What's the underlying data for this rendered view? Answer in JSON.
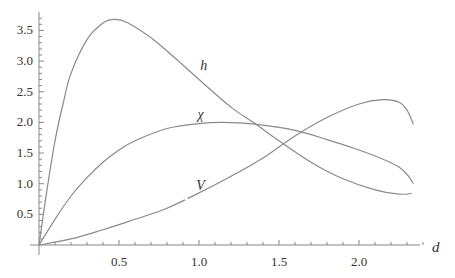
{
  "chart_data": {
    "type": "line",
    "title": "",
    "xlabel": "d",
    "ylabel": "",
    "xlim": [
      0,
      2.45
    ],
    "ylim": [
      0,
      3.8
    ],
    "grid": false,
    "legend": "inline curve labels",
    "x_ticks": [
      0.5,
      1.0,
      1.5,
      2.0
    ],
    "x_tick_labels": [
      "0.5",
      "1.0",
      "1.5",
      "2.0"
    ],
    "y_ticks": [
      0.5,
      1.0,
      1.5,
      2.0,
      2.5,
      3.0,
      3.5
    ],
    "y_tick_labels": [
      "0.5",
      "1.0",
      "1.5",
      "2.0",
      "2.5",
      "3.0",
      "3.5"
    ],
    "series": [
      {
        "name": "h",
        "label_pos": [
          1.03,
          2.85
        ],
        "points": [
          [
            0,
            0
          ],
          [
            0.05,
            0.9
          ],
          [
            0.1,
            1.7
          ],
          [
            0.15,
            2.3
          ],
          [
            0.2,
            2.8
          ],
          [
            0.3,
            3.35
          ],
          [
            0.4,
            3.62
          ],
          [
            0.47,
            3.68
          ],
          [
            0.55,
            3.63
          ],
          [
            0.7,
            3.38
          ],
          [
            0.85,
            3.05
          ],
          [
            1.0,
            2.7
          ],
          [
            1.2,
            2.25
          ],
          [
            1.35,
            1.98
          ],
          [
            1.5,
            1.7
          ],
          [
            1.7,
            1.35
          ],
          [
            1.9,
            1.08
          ],
          [
            2.1,
            0.9
          ],
          [
            2.25,
            0.83
          ],
          [
            2.33,
            0.84
          ]
        ]
      },
      {
        "name": "χ",
        "label_pos": [
          1.01,
          2.05
        ],
        "points": [
          [
            0,
            0
          ],
          [
            0.1,
            0.42
          ],
          [
            0.2,
            0.8
          ],
          [
            0.3,
            1.1
          ],
          [
            0.4,
            1.35
          ],
          [
            0.5,
            1.55
          ],
          [
            0.6,
            1.7
          ],
          [
            0.8,
            1.9
          ],
          [
            1.0,
            1.98
          ],
          [
            1.15,
            2.0
          ],
          [
            1.35,
            1.97
          ],
          [
            1.6,
            1.87
          ],
          [
            1.8,
            1.72
          ],
          [
            2.0,
            1.55
          ],
          [
            2.15,
            1.4
          ],
          [
            2.25,
            1.27
          ],
          [
            2.31,
            1.12
          ],
          [
            2.34,
            1.0
          ]
        ]
      },
      {
        "name": "V",
        "label_pos": [
          1.01,
          0.9
        ],
        "gap_at": 0.92,
        "points": [
          [
            0,
            0
          ],
          [
            0.2,
            0.1
          ],
          [
            0.4,
            0.25
          ],
          [
            0.6,
            0.42
          ],
          [
            0.8,
            0.6
          ],
          [
            1.0,
            0.85
          ],
          [
            1.2,
            1.12
          ],
          [
            1.4,
            1.42
          ],
          [
            1.6,
            1.78
          ],
          [
            1.8,
            2.08
          ],
          [
            2.0,
            2.3
          ],
          [
            2.15,
            2.37
          ],
          [
            2.25,
            2.33
          ],
          [
            2.3,
            2.2
          ],
          [
            2.34,
            1.97
          ]
        ]
      }
    ]
  },
  "labels": {
    "x_axis": "d",
    "h": "h",
    "chi": "χ",
    "v": "V"
  }
}
